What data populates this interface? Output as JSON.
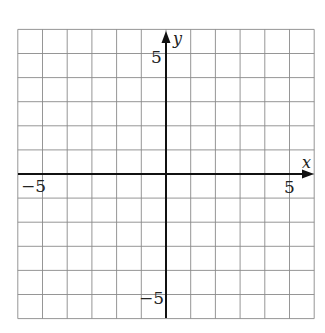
{
  "chart_data": {
    "type": "line",
    "title": "",
    "xlabel": "x",
    "ylabel": "y",
    "xlim": [
      -6,
      6
    ],
    "ylim": [
      -6,
      6
    ],
    "grid": true,
    "grid_step": 1,
    "series": [],
    "tick_labels": {
      "x": [
        {
          "value": -5,
          "label": "−5"
        },
        {
          "value": 5,
          "label": "5"
        }
      ],
      "y": [
        {
          "value": 5,
          "label": "5"
        },
        {
          "value": -5,
          "label": "−5"
        }
      ]
    }
  },
  "labels": {
    "x_axis": "x",
    "y_axis": "y",
    "x_neg": "−5",
    "x_pos": "5",
    "y_pos": "5",
    "y_neg": "−5"
  }
}
